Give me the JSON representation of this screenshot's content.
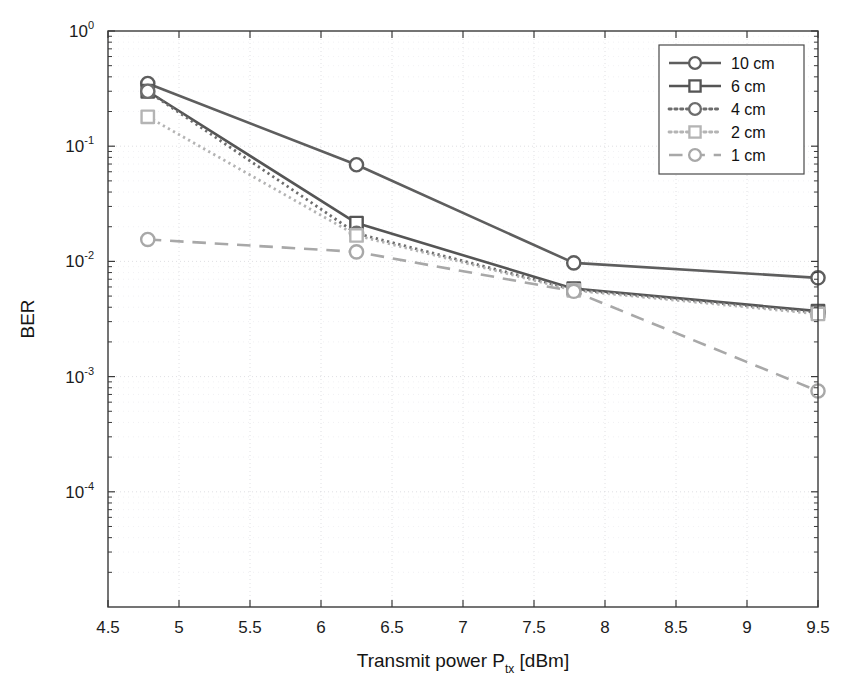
{
  "chart_data": {
    "type": "line",
    "title": "",
    "xlabel": "Transmit power P_tx [dBm]",
    "xlabel_main": "Transmit power P",
    "xlabel_sub": "tx",
    "xlabel_unit": "[dBm]",
    "ylabel": "BER",
    "yscale": "log",
    "xscale": "linear",
    "xlim": [
      4.5,
      9.5
    ],
    "ylim": [
      1e-05,
      1
    ],
    "grid": true,
    "legend_position": "top-right",
    "xticks": [
      4.5,
      5,
      5.5,
      6,
      6.5,
      7,
      7.5,
      8,
      8.5,
      9,
      9.5
    ],
    "xticklabels": [
      "4.5",
      "5",
      "5.5",
      "6",
      "6.5",
      "7",
      "7.5",
      "8",
      "8.5",
      "9",
      "9.5"
    ],
    "yticks": [
      1,
      0.1,
      0.01,
      0.001,
      0.0001
    ],
    "yticklabels": [
      "10^0",
      "10^-1",
      "10^-2",
      "10^-3",
      "10^-4"
    ],
    "ytick_mantissa": "10",
    "ytick_exponents": [
      "0",
      "-1",
      "-2",
      "-3",
      "-4"
    ],
    "x": [
      4.78,
      6.25,
      7.78,
      9.5
    ],
    "series": [
      {
        "name": "10 cm",
        "label": "10 cm",
        "values": [
          0.35,
          0.069,
          0.0097,
          0.0072
        ],
        "color": "#5e5e5e",
        "linestyle": "solid",
        "marker": "circle",
        "linewidth": 2.6
      },
      {
        "name": "6 cm",
        "label": "6 cm",
        "values": [
          0.3,
          0.0215,
          0.0058,
          0.0037
        ],
        "color": "#555555",
        "linestyle": "solid",
        "marker": "square",
        "linewidth": 2.6
      },
      {
        "name": "4 cm",
        "label": "4 cm",
        "values": [
          0.3,
          0.0175,
          0.0057,
          0.0036
        ],
        "color": "#6d6d6d",
        "linestyle": "dotted",
        "marker": "circle",
        "linewidth": 2.8
      },
      {
        "name": "2 cm",
        "label": "2 cm",
        "values": [
          0.18,
          0.0168,
          0.0056,
          0.0035
        ],
        "color": "#b4b4b4",
        "linestyle": "dotted",
        "marker": "square",
        "linewidth": 2.8
      },
      {
        "name": "1 cm",
        "label": "1 cm",
        "values": [
          0.0155,
          0.0121,
          0.0055,
          0.00075
        ],
        "color": "#a8a8a8",
        "linestyle": "dashed",
        "marker": "circle",
        "linewidth": 2.6
      }
    ]
  }
}
